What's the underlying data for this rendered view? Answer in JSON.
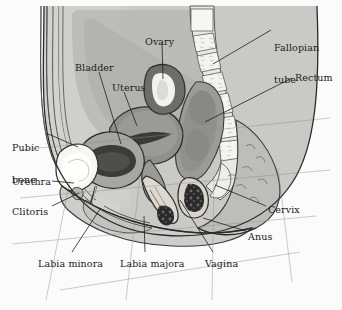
{
  "figure": {
    "width": 342,
    "height": 310,
    "background_color": "#fbfbfb",
    "line_color": "#2b2b2b",
    "label_color": "#1a1a1a",
    "style": "grayscale medical line illustration"
  },
  "palette": {
    "background": "#fbfbfb",
    "body_fill": "#c8c8c6",
    "body_fill_light": "#d6d6d3",
    "skin_outer": "#bdbdba",
    "muscle_mid": "#a9a9a6",
    "organ_dark": "#8b8b89",
    "organ_darker": "#6f6f6e",
    "cavity_dark": "#3d3d3d",
    "bone_white": "#f4f4f0",
    "rectum_mass": "#8a8a88",
    "texture_black": "#262626",
    "outline": "#2b2b2b"
  },
  "labels": [
    {
      "id": "fallopian-tube",
      "text": "Fallopian",
      "text2": "tube",
      "x": 274,
      "y": 22,
      "align": "left"
    },
    {
      "id": "ovary",
      "text": "Ovary",
      "x": 145,
      "y": 37,
      "align": "left"
    },
    {
      "id": "rectum",
      "text": "Rectum",
      "x": 295,
      "y": 73,
      "align": "left"
    },
    {
      "id": "bladder",
      "text": "Bladder",
      "x": 75,
      "y": 63,
      "align": "left"
    },
    {
      "id": "uterus",
      "text": "Uterus",
      "x": 112,
      "y": 83,
      "align": "left"
    },
    {
      "id": "pubic-bone",
      "text": "Pubic",
      "text2": "bone",
      "x": 12,
      "y": 122,
      "align": "left"
    },
    {
      "id": "urethra",
      "text": "Urethra",
      "x": 12,
      "y": 177,
      "align": "left"
    },
    {
      "id": "clitoris",
      "text": "Clitoris",
      "x": 12,
      "y": 207,
      "align": "left"
    },
    {
      "id": "cervix",
      "text": "Cervix",
      "x": 268,
      "y": 205,
      "align": "left"
    },
    {
      "id": "anus",
      "text": "Anus",
      "x": 248,
      "y": 232,
      "align": "left"
    },
    {
      "id": "labia-minora",
      "text": "Labia minora",
      "x": 38,
      "y": 259,
      "align": "left"
    },
    {
      "id": "labia-majora",
      "text": "Labia majora",
      "x": 120,
      "y": 259,
      "align": "left"
    },
    {
      "id": "vagina",
      "text": "Vagina",
      "x": 205,
      "y": 259,
      "align": "left"
    }
  ],
  "leader_lines": [
    {
      "id": "fallopian-tube",
      "x1": 271,
      "y1": 30,
      "x2": 213,
      "y2": 64
    },
    {
      "id": "ovary",
      "x1": 162,
      "y1": 43,
      "x2": 163,
      "y2": 79
    },
    {
      "id": "rectum",
      "x1": 292,
      "y1": 78,
      "x2": 205,
      "y2": 122
    },
    {
      "id": "bladder",
      "x1": 99,
      "y1": 72,
      "x2": 121,
      "y2": 144
    },
    {
      "id": "uterus",
      "x1": 124,
      "y1": 92,
      "x2": 137,
      "y2": 126
    },
    {
      "id": "pubic-bone",
      "x1": 46,
      "y1": 133,
      "x2": 78,
      "y2": 147
    },
    {
      "id": "urethra",
      "x1": 52,
      "y1": 181,
      "x2": 72,
      "y2": 181
    },
    {
      "id": "clitoris",
      "x1": 52,
      "y1": 206,
      "x2": 79,
      "y2": 193
    },
    {
      "id": "cervix",
      "x1": 266,
      "y1": 206,
      "x2": 215,
      "y2": 185
    },
    {
      "id": "anus",
      "x1": 246,
      "y1": 231,
      "x2": 203,
      "y2": 218
    },
    {
      "id": "labia-minora",
      "x1": 72,
      "y1": 252,
      "x2": 98,
      "y2": 208
    },
    {
      "id": "labia-majora",
      "x1": 145,
      "y1": 252,
      "x2": 144,
      "y2": 215
    },
    {
      "id": "vagina",
      "x1": 213,
      "y1": 252,
      "x2": 181,
      "y2": 199
    }
  ],
  "structures": [
    {
      "id": "abdominal-wall",
      "name": "abdominal wall layers"
    },
    {
      "id": "spine-sacrum",
      "name": "sacrum and vertebrae"
    },
    {
      "id": "uterus-body",
      "name": "uterus"
    },
    {
      "id": "ovary-body",
      "name": "ovary"
    },
    {
      "id": "bladder-cavity",
      "name": "bladder"
    },
    {
      "id": "pubic-bone-body",
      "name": "pubic bone"
    },
    {
      "id": "rectum-body",
      "name": "rectum"
    },
    {
      "id": "vaginal-canal",
      "name": "vagina"
    },
    {
      "id": "anal-canal",
      "name": "anus"
    },
    {
      "id": "buttock",
      "name": "buttock soft tissue"
    },
    {
      "id": "perineum",
      "name": "perineum and labia"
    }
  ]
}
